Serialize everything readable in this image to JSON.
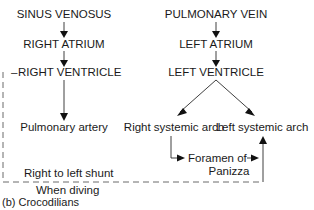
{
  "diagram": {
    "caption": "(b) Crocodilians",
    "right_side": {
      "sinus_venosus": "SINUS VENOSUS",
      "right_atrium": "RIGHT ATRIUM",
      "right_ventricle": "RIGHT VENTRICLE",
      "right_ventricle_prefix": "–",
      "pulmonary_artery": "Pulmonary artery"
    },
    "left_side": {
      "pulmonary_vein": "PULMONARY VEIN",
      "left_atrium": "LEFT ATRIUM",
      "left_ventricle": "LEFT VENTRICLE",
      "right_systemic_arch": "Right systemic arch",
      "left_systemic_arch": "Left systemic arch"
    },
    "foramen": {
      "line1": "Foramen of",
      "line2": "Panizza"
    },
    "shunt": {
      "label": "Right to left shunt",
      "condition": "When diving"
    },
    "colors": {
      "text": "#1a1a1a",
      "line": "#2a2a2a",
      "dashed": "#6a6a6a",
      "background": "#ffffff"
    }
  }
}
